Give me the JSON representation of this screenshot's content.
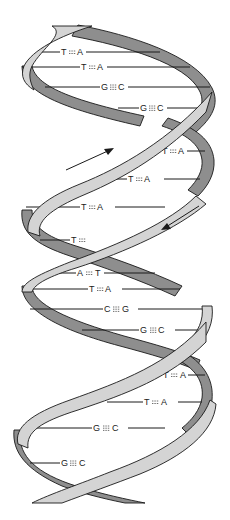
{
  "diagram": {
    "colors": {
      "front_strand": "#d4d4d4",
      "back_strand": "#8e8e8e",
      "outline": "#1a1a1a",
      "background": "#ffffff"
    },
    "arrows": [
      {
        "name": "strand-direction-up",
        "direction": "5' to 3' upward"
      },
      {
        "name": "strand-direction-down",
        "direction": "5' to 3' downward"
      }
    ],
    "base_pairs": [
      {
        "left": "T",
        "right": "A",
        "bonds": 2
      },
      {
        "left": "T",
        "right": "A",
        "bonds": 2
      },
      {
        "left": "G",
        "right": "C",
        "bonds": 3
      },
      {
        "left": "G",
        "right": "C",
        "bonds": 3
      },
      {
        "left": "T",
        "right": "A",
        "bonds": 2
      },
      {
        "left": "T",
        "right": "A",
        "bonds": 2
      },
      {
        "left": "T",
        "right": "A",
        "bonds": 2
      },
      {
        "left": "T",
        "right": "",
        "bonds": 2
      },
      {
        "left": "A",
        "right": "T",
        "bonds": 2
      },
      {
        "left": "T",
        "right": "A",
        "bonds": 2
      },
      {
        "left": "C",
        "right": "G",
        "bonds": 3
      },
      {
        "left": "G",
        "right": "C",
        "bonds": 3
      },
      {
        "left": "T",
        "right": "A",
        "bonds": 2
      },
      {
        "left": "T",
        "right": "A",
        "bonds": 2
      },
      {
        "left": "G",
        "right": "C",
        "bonds": 3
      },
      {
        "left": "G",
        "right": "C",
        "bonds": 3
      }
    ]
  }
}
